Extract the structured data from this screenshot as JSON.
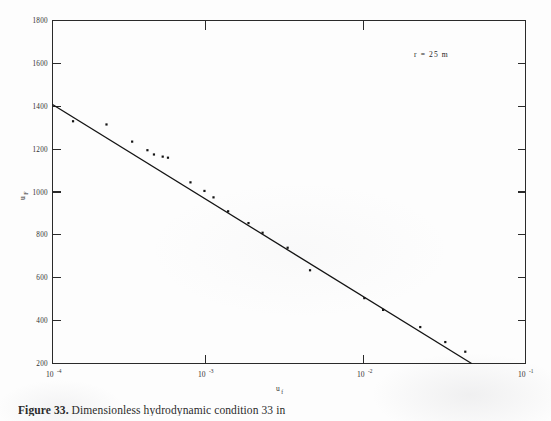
{
  "figure": {
    "caption_label": "Figure 33.",
    "caption_text": "Dimensionless hydrodynamic condition   33 in",
    "annotation": "r = 25 m"
  },
  "chart_data": {
    "type": "scatter",
    "title": "",
    "subtitle": "",
    "xlabel": "u_f",
    "ylabel": "u_F",
    "xscale": "log",
    "yscale": "linear",
    "xlim": [
      0.0001,
      0.1
    ],
    "ylim": [
      200,
      1800
    ],
    "grid": false,
    "legend": "none",
    "annotations": [
      {
        "text": "r = 25 m",
        "x": 0.022,
        "y": 1690
      }
    ],
    "x_tick_labels": [
      "10-4",
      "10-3",
      "10-2",
      "10-1"
    ],
    "x_tick_bases": [
      "10",
      "10",
      "10",
      "10"
    ],
    "x_tick_exponents": [
      "-4",
      "-3",
      "-2",
      "-1"
    ],
    "x_tick_values": [
      0.0001,
      0.001,
      0.01,
      0.1
    ],
    "y_tick_labels": [
      "1800",
      "1600",
      "1400",
      "1200",
      "1000",
      "800",
      "600",
      "400",
      "200"
    ],
    "y_tick_values": [
      1800,
      1600,
      1400,
      1200,
      1000,
      800,
      600,
      400,
      200
    ],
    "series": [
      {
        "name": "measured points",
        "marker": "dot",
        "x": [
          0.000135,
          0.00022,
          0.00032,
          0.0004,
          0.00044,
          0.0005,
          0.00054,
          0.00075,
          0.00092,
          0.00105,
          0.0013,
          0.00175,
          0.00215,
          0.0031,
          0.0043,
          0.0095,
          0.0125,
          0.0215,
          0.031,
          0.0415
        ],
        "y": [
          1330,
          1315,
          1235,
          1195,
          1175,
          1165,
          1160,
          1045,
          1005,
          975,
          910,
          855,
          810,
          740,
          635,
          505,
          450,
          370,
          300,
          255
        ]
      },
      {
        "name": "fit line",
        "marker": "line",
        "x": [
          0.0001,
          0.0455
        ],
        "y": [
          1408,
          200
        ]
      }
    ]
  }
}
